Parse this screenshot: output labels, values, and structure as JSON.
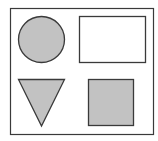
{
  "diagram": {
    "frame": {
      "x": 10.5,
      "y": 8.5,
      "width": 143,
      "height": 126,
      "stroke": "#3a3a3a",
      "stroke_width": 1.2,
      "fill": "#ffffff"
    },
    "shapes": [
      {
        "type": "circle",
        "name": "circle",
        "cx": 41.5,
        "cy": 39.5,
        "r": 23,
        "fill": "#c2c2c2",
        "stroke": "#3a3a3a"
      },
      {
        "type": "rectangle",
        "name": "rectangle",
        "x": 79.5,
        "y": 16.5,
        "width": 66,
        "height": 46,
        "fill": "#ffffff",
        "stroke": "#3a3a3a"
      },
      {
        "type": "triangle",
        "name": "triangle",
        "points": "18.5,79.5 64.5,79.5 41.5,126",
        "fill": "#c2c2c2",
        "stroke": "#3a3a3a"
      },
      {
        "type": "square",
        "name": "square",
        "x": 88.5,
        "y": 79.5,
        "width": 45,
        "height": 46,
        "fill": "#c2c2c2",
        "stroke": "#3a3a3a"
      }
    ]
  }
}
